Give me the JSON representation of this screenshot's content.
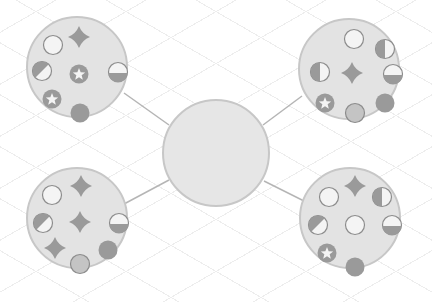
{
  "colors": {
    "background": "#ffffff",
    "node_fill": "#e3e3e3",
    "node_stroke": "#c7c7c7",
    "symbol_fill": "#9a9a9a",
    "symbol_light": "#f4f4f4",
    "symbol_stroke": "#8c8c8c",
    "connector": "#b5b5b5"
  },
  "hub": {
    "cx": 216,
    "cy": 153,
    "r": 53
  },
  "nodes": [
    {
      "id": "top-left",
      "cx": 77,
      "cy": 67,
      "r": 50,
      "symbols": [
        {
          "type": "empty-circle",
          "x": 53,
          "y": 45
        },
        {
          "type": "four-point-star",
          "x": 79,
          "y": 37
        },
        {
          "type": "diagonal-half-circle",
          "x": 42,
          "y": 71
        },
        {
          "type": "star-circle",
          "x": 79,
          "y": 74
        },
        {
          "type": "bottom-half-circle",
          "x": 118,
          "y": 72
        },
        {
          "type": "star-circle",
          "x": 52,
          "y": 99
        },
        {
          "type": "filled-circle",
          "x": 80,
          "y": 113
        }
      ]
    },
    {
      "id": "top-right",
      "cx": 349,
      "cy": 69,
      "r": 50,
      "symbols": [
        {
          "type": "empty-circle",
          "x": 354,
          "y": 39
        },
        {
          "type": "left-half-circle",
          "x": 385,
          "y": 49
        },
        {
          "type": "left-half-circle",
          "x": 320,
          "y": 72
        },
        {
          "type": "four-point-star",
          "x": 352,
          "y": 73
        },
        {
          "type": "bottom-half-circle",
          "x": 393,
          "y": 74
        },
        {
          "type": "star-circle",
          "x": 325,
          "y": 103
        },
        {
          "type": "shaded-circle",
          "x": 355,
          "y": 113
        },
        {
          "type": "filled-circle",
          "x": 385,
          "y": 103
        }
      ]
    },
    {
      "id": "bottom-left",
      "cx": 77,
      "cy": 218,
      "r": 50,
      "symbols": [
        {
          "type": "empty-circle",
          "x": 52,
          "y": 195
        },
        {
          "type": "four-point-star",
          "x": 81,
          "y": 186
        },
        {
          "type": "diagonal-half-circle",
          "x": 43,
          "y": 223
        },
        {
          "type": "four-point-star",
          "x": 80,
          "y": 222
        },
        {
          "type": "bottom-half-circle",
          "x": 119,
          "y": 223
        },
        {
          "type": "four-point-star",
          "x": 55,
          "y": 248
        },
        {
          "type": "filled-circle",
          "x": 108,
          "y": 250
        },
        {
          "type": "shaded-circle",
          "x": 80,
          "y": 264
        }
      ]
    },
    {
      "id": "bottom-right",
      "cx": 350,
      "cy": 218,
      "r": 50,
      "symbols": [
        {
          "type": "empty-circle",
          "x": 329,
          "y": 197
        },
        {
          "type": "four-point-star",
          "x": 355,
          "y": 186
        },
        {
          "type": "left-half-circle",
          "x": 382,
          "y": 197
        },
        {
          "type": "diagonal-half-circle",
          "x": 318,
          "y": 225
        },
        {
          "type": "empty-circle",
          "x": 355,
          "y": 225
        },
        {
          "type": "bottom-half-circle",
          "x": 392,
          "y": 225
        },
        {
          "type": "star-circle",
          "x": 327,
          "y": 253
        },
        {
          "type": "filled-circle",
          "x": 355,
          "y": 267
        }
      ]
    }
  ],
  "connectors": [
    {
      "from": "top-left",
      "x1": 124,
      "y1": 93,
      "x2": 169,
      "y2": 125
    },
    {
      "from": "top-right",
      "x1": 302,
      "y1": 96,
      "x2": 263,
      "y2": 125
    },
    {
      "from": "bottom-left",
      "x1": 124,
      "y1": 204,
      "x2": 169,
      "y2": 180
    },
    {
      "from": "bottom-right",
      "x1": 304,
      "y1": 201,
      "x2": 264,
      "y2": 181
    }
  ]
}
